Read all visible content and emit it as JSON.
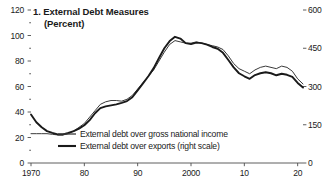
{
  "chart_data": {
    "type": "line",
    "title": "1. External Debt Measures",
    "subtitle": "(Percent)",
    "xlabel": "",
    "ylabel": "",
    "grid": false,
    "legend_position": "inside-bottom-left",
    "xlim": [
      1970,
      2021
    ],
    "ylim": [
      0,
      120
    ],
    "y2lim": [
      0,
      600
    ],
    "x_ticks": [
      {
        "value": 1970,
        "label": "1970"
      },
      {
        "value": 1980,
        "label": "80"
      },
      {
        "value": 1990,
        "label": "90"
      },
      {
        "value": 2000,
        "label": "2000"
      },
      {
        "value": 2010,
        "label": "10"
      },
      {
        "value": 2020,
        "label": "20"
      }
    ],
    "y_ticks_left": [
      {
        "value": 0,
        "label": "0"
      },
      {
        "value": 20,
        "label": "20"
      },
      {
        "value": 40,
        "label": "40"
      },
      {
        "value": 60,
        "label": "60"
      },
      {
        "value": 80,
        "label": "80"
      },
      {
        "value": 100,
        "label": "100"
      },
      {
        "value": 120,
        "label": "120"
      }
    ],
    "y_minor_ticks_left": [
      10,
      30,
      50,
      70,
      90,
      110
    ],
    "y_ticks_right": [
      {
        "value": 0,
        "label": "0"
      },
      {
        "value": 150,
        "label": "150"
      },
      {
        "value": 300,
        "label": "300"
      },
      {
        "value": 450,
        "label": "450"
      },
      {
        "value": 600,
        "label": "600"
      }
    ],
    "x": [
      1970,
      1971,
      1972,
      1973,
      1974,
      1975,
      1976,
      1977,
      1978,
      1979,
      1980,
      1981,
      1982,
      1983,
      1984,
      1985,
      1986,
      1987,
      1988,
      1989,
      1990,
      1991,
      1992,
      1993,
      1994,
      1995,
      1996,
      1997,
      1998,
      1999,
      2000,
      2001,
      2002,
      2003,
      2004,
      2005,
      2006,
      2007,
      2008,
      2009,
      2010,
      2011,
      2012,
      2013,
      2014,
      2015,
      2016,
      2017,
      2018,
      2019,
      2020,
      2021
    ],
    "series": [
      {
        "name": "External debt over gross national income",
        "axis": "left",
        "style": "thin",
        "color": "#3a3a3a",
        "values": [
          23,
          23,
          23,
          23,
          22.5,
          22,
          22,
          23,
          25,
          28,
          31,
          36,
          41,
          46,
          48,
          49,
          49,
          48.5,
          50,
          53,
          58,
          63,
          68,
          73,
          80,
          87,
          93,
          96,
          95,
          94,
          94,
          95,
          94,
          93,
          92,
          91,
          89,
          84,
          78,
          74,
          72,
          70,
          73,
          75,
          76,
          75,
          74,
          76,
          75,
          72,
          66,
          62
        ]
      },
      {
        "name": "External debt over exports (right scale)",
        "axis": "right",
        "style": "thick",
        "color": "#1a1a1a",
        "values": [
          190,
          160,
          140,
          125,
          118,
          112,
          112,
          118,
          125,
          135,
          148,
          168,
          195,
          215,
          222,
          226,
          230,
          236,
          243,
          258,
          285,
          312,
          340,
          372,
          412,
          450,
          478,
          495,
          488,
          470,
          466,
          472,
          470,
          464,
          455,
          448,
          432,
          404,
          375,
          352,
          340,
          330,
          345,
          352,
          356,
          352,
          344,
          350,
          346,
          338,
          314,
          296
        ]
      }
    ],
    "legend": [
      {
        "label": "External debt over gross national income",
        "style": "thin"
      },
      {
        "label": "External debt over exports (right scale)",
        "style": "thick"
      }
    ]
  }
}
